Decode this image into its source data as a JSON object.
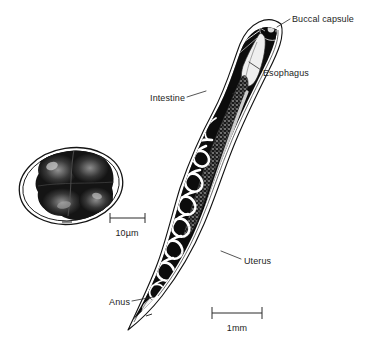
{
  "figure": {
    "background_color": "#ffffff",
    "ink_color": "#111111",
    "text_color": "#1d1d1d"
  },
  "labels": [
    {
      "id": "buccal-capsule",
      "text": "Buccal capsule",
      "anchor": "start",
      "x": 292,
      "y": 20,
      "leader": "M 286 21 L 276 27"
    },
    {
      "id": "esophagus",
      "text": "Esophagus",
      "anchor": "start",
      "x": 263,
      "y": 73,
      "leader": "M 259 70 L 249 63"
    },
    {
      "id": "intestine",
      "text": "Intestine",
      "anchor": "end",
      "x": 185,
      "y": 100,
      "leader": "M 188 97 L 204 92"
    },
    {
      "id": "uterus",
      "text": "Uterus",
      "anchor": "start",
      "x": 243,
      "y": 262,
      "leader": "M 240 259 L 222 252"
    },
    {
      "id": "anus",
      "text": "Anus",
      "anchor": "end",
      "x": 130,
      "y": 304,
      "leader": "M 133 301 L 152 297"
    }
  ],
  "scale_bars": [
    {
      "id": "egg-scale",
      "label": "10µm",
      "x1": 110,
      "x2": 145,
      "y": 218,
      "label_x": 127,
      "label_y": 234,
      "subject": "egg"
    },
    {
      "id": "worm-scale",
      "label": "1mm",
      "x1": 212,
      "x2": 262,
      "y": 313,
      "label_x": 237,
      "label_y": 329,
      "subject": "adult worm"
    }
  ],
  "structures": {
    "egg": {
      "name": "egg",
      "description": "oval shelled egg containing dark granular morula of cleaving cells",
      "center_x": 71,
      "center_y": 186,
      "radius_x": 52,
      "radius_y": 38
    },
    "worm": {
      "name": "adult female worm",
      "description": "elongate S-curved body, head hooked to upper right, tail tapering to a point at lower left",
      "head_x": 280,
      "head_y": 26,
      "tail_x": 128,
      "tail_y": 330
    }
  }
}
